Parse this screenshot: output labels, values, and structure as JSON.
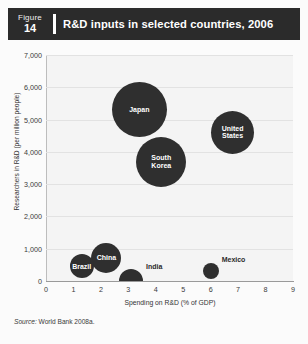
{
  "header": {
    "figure_word": "Figure",
    "figure_number": "14",
    "title": "R&D inputs in selected countries, 2006",
    "bar_color": "#2b2b2b"
  },
  "source": {
    "prefix": "Source:",
    "text": " World Bank 2008a."
  },
  "chart_data": {
    "type": "scatter",
    "title": "R&D inputs in selected countries, 2006",
    "xlabel": "Spending on R&D (% of GDP)",
    "ylabel": "Researchers in R&D (per million people)",
    "xlim": [
      0,
      9
    ],
    "ylim": [
      0,
      7000
    ],
    "xticks": [
      "0",
      "1",
      "2",
      "3",
      "4",
      "5",
      "6",
      "7",
      "8",
      "9"
    ],
    "yticks": [
      "0",
      "1,000",
      "2,000",
      "3,000",
      "4,000",
      "5,000",
      "6,000",
      "7,000"
    ],
    "grid": true,
    "legend": "none",
    "bubble_color": "#2f2f2f",
    "points": [
      {
        "label": "Japan",
        "x": 3.4,
        "y": 5300,
        "size": 55,
        "label_position": "inside",
        "clipped": false
      },
      {
        "label": "United States",
        "x": 6.8,
        "y": 4600,
        "size": 43,
        "label_position": "inside",
        "clipped": false
      },
      {
        "label": "South Korea",
        "x": 4.2,
        "y": 3700,
        "size": 50,
        "label_position": "inside",
        "clipped": false
      },
      {
        "label": "China",
        "x": 2.2,
        "y": 700,
        "size": 30,
        "label_position": "inside",
        "clipped": false
      },
      {
        "label": "Brazil",
        "x": 1.3,
        "y": 450,
        "size": 24,
        "label_position": "inside",
        "clipped": false
      },
      {
        "label": "India",
        "x": 3.1,
        "y": 130,
        "size": 24,
        "label_position": "outside",
        "clipped": true
      },
      {
        "label": "Mexico",
        "x": 6.0,
        "y": 300,
        "size": 16,
        "label_position": "outside",
        "clipped": false
      }
    ]
  }
}
